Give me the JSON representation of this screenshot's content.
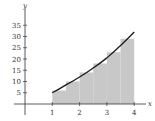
{
  "chart_data": {
    "type": "area",
    "title": "",
    "xlabel": "x",
    "ylabel": "y",
    "xlim": [
      0,
      4.3
    ],
    "ylim": [
      0,
      38
    ],
    "x_ticks": [
      1,
      2,
      3,
      4
    ],
    "y_ticks": [
      5,
      10,
      15,
      20,
      25,
      30,
      35
    ],
    "grid": false,
    "legend": null,
    "curve": {
      "name": "f(x)",
      "x": [
        1,
        1.5,
        2,
        2.5,
        3,
        3.5,
        4
      ],
      "y": [
        5,
        8.5,
        12,
        16,
        20.5,
        26,
        32
      ]
    },
    "rectangles": {
      "width": 0.5,
      "x_left": [
        1,
        1.5,
        2,
        2.5,
        3,
        3.5
      ],
      "heights": [
        6,
        10,
        14,
        18,
        23,
        29
      ]
    },
    "colors": {
      "curve": "#1a1a1a",
      "rectangles": "#c8c8c8",
      "axes": "#333333"
    }
  },
  "labels": {
    "x_axis": "x",
    "y_axis": "y",
    "x_ticks": [
      "1",
      "2",
      "3",
      "4"
    ],
    "y_ticks": [
      "5",
      "10",
      "15",
      "20",
      "25",
      "30",
      "35"
    ]
  }
}
